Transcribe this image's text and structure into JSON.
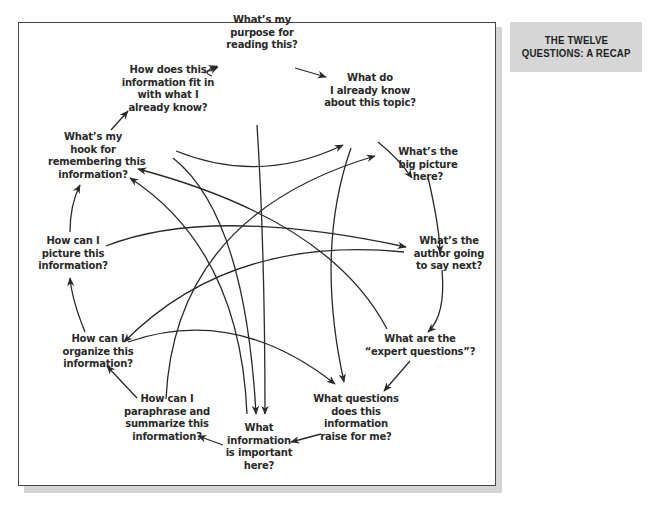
{
  "sidebar": {
    "title_lines": [
      "THE TWELVE",
      "QUESTIONS: A RECAP"
    ],
    "background": "#d6d6d6"
  },
  "diagram": {
    "nodes": [
      {
        "id": "purpose",
        "lines": [
          "What’s my",
          "purpose for",
          "reading this?"
        ]
      },
      {
        "id": "already_know",
        "lines": [
          "What do",
          "I already know",
          "about this topic?"
        ]
      },
      {
        "id": "big_picture",
        "lines": [
          "What’s the",
          "big picture",
          "here?"
        ]
      },
      {
        "id": "author_next",
        "lines": [
          "What’s the",
          "author going",
          "to say next?"
        ]
      },
      {
        "id": "expert_questions",
        "lines": [
          "What are the",
          "“expert questions”?"
        ]
      },
      {
        "id": "questions_raise",
        "lines": [
          "What questions",
          "does this",
          "information",
          "raise for me?"
        ]
      },
      {
        "id": "important",
        "lines": [
          "What",
          "information",
          "is important",
          "here?"
        ]
      },
      {
        "id": "paraphrase",
        "lines": [
          "How can I",
          "paraphrase and",
          "summarize this",
          "information?"
        ]
      },
      {
        "id": "organize",
        "lines": [
          "How can I",
          "organize this",
          "information?"
        ]
      },
      {
        "id": "picture",
        "lines": [
          "How can I",
          "picture this",
          "information?"
        ]
      },
      {
        "id": "hook",
        "lines": [
          "What’s my",
          "hook for",
          "remembering this",
          "information?"
        ]
      },
      {
        "id": "fit_in",
        "lines": [
          "How does this",
          "information fit in",
          "with what I",
          "already know?"
        ]
      }
    ],
    "cycle_order": [
      "purpose",
      "already_know",
      "big_picture",
      "author_next",
      "expert_questions",
      "questions_raise",
      "important",
      "paraphrase",
      "organize",
      "picture",
      "hook",
      "fit_in"
    ],
    "cross_links": [
      {
        "from": "fit_in",
        "to": "already_know"
      },
      {
        "from": "fit_in",
        "to": "important"
      },
      {
        "from": "purpose",
        "to": "important"
      },
      {
        "from": "already_know",
        "to": "questions_raise"
      },
      {
        "from": "picture",
        "to": "author_next"
      },
      {
        "from": "author_next",
        "to": "organize"
      },
      {
        "from": "paraphrase",
        "to": "big_picture"
      },
      {
        "from": "expert_questions",
        "to": "hook"
      },
      {
        "from": "important",
        "to": "hook"
      },
      {
        "from": "organize",
        "to": "questions_raise"
      }
    ],
    "stroke_color": "#2a2a2a"
  }
}
